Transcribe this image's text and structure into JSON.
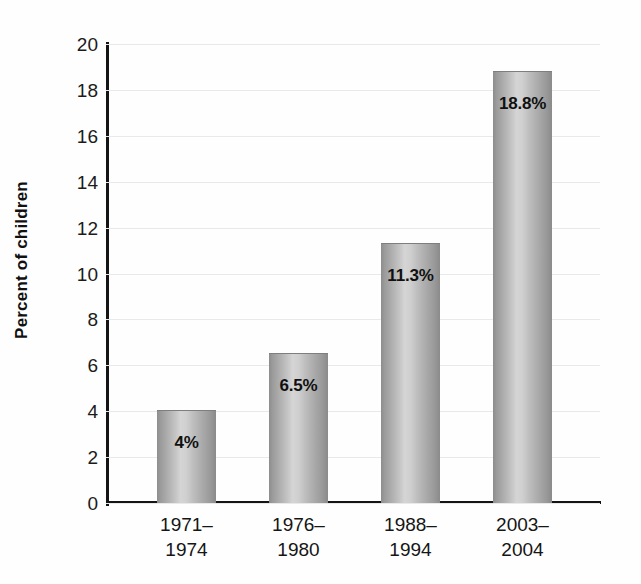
{
  "chart_data": {
    "type": "bar",
    "title": "",
    "subtitle": "",
    "xlabel": "",
    "ylabel": "Percent of children",
    "categories": [
      "1971–\n1974",
      "1976–\n1980",
      "1988–\n1994",
      "2003–\n2004"
    ],
    "category_lines": [
      [
        "1971–",
        "1974"
      ],
      [
        "1976–",
        "1980"
      ],
      [
        "1988–",
        "1994"
      ],
      [
        "2003–",
        "2004"
      ]
    ],
    "values": [
      4,
      6.5,
      11.3,
      18.8
    ],
    "data_labels": [
      "4%",
      "6.5%",
      "11.3%",
      "18.8%"
    ],
    "ylim": [
      0,
      20
    ],
    "ytick_values": [
      0,
      2,
      4,
      6,
      8,
      10,
      12,
      14,
      16,
      18,
      20
    ],
    "ytick_labels": [
      "0",
      "2",
      "4",
      "6",
      "8",
      "10",
      "12",
      "14",
      "16",
      "18",
      "20"
    ],
    "grid": true,
    "grid_color": "#e9e9ec",
    "legend": "none",
    "bar_fill": "#b8b8b8",
    "bar_edge": "#8a8a8a",
    "axis_color": "#141414",
    "background": "#fefefe",
    "text_color": "#151515"
  },
  "axis": {
    "y_title": "Percent of children"
  },
  "ticks": {
    "y": [
      {
        "label": "20",
        "value": 20
      },
      {
        "label": "18",
        "value": 18
      },
      {
        "label": "16",
        "value": 16
      },
      {
        "label": "14",
        "value": 14
      },
      {
        "label": "12",
        "value": 12
      },
      {
        "label": "10",
        "value": 10
      },
      {
        "label": "8",
        "value": 8
      },
      {
        "label": "6",
        "value": 6
      },
      {
        "label": "4",
        "value": 4
      },
      {
        "label": "2",
        "value": 2
      },
      {
        "label": "0",
        "value": 0
      }
    ]
  },
  "bars": [
    {
      "label_top": "1971–",
      "label_bottom": "1974",
      "value": 4,
      "data_label": "4%"
    },
    {
      "label_top": "1976–",
      "label_bottom": "1980",
      "value": 6.5,
      "data_label": "6.5%"
    },
    {
      "label_top": "1988–",
      "label_bottom": "1994",
      "value": 11.3,
      "data_label": "11.3%"
    },
    {
      "label_top": "2003–",
      "label_bottom": "2004",
      "value": 18.8,
      "data_label": "18.8%"
    }
  ]
}
